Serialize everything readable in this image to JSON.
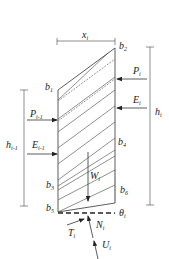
{
  "diagram": {
    "dimension_labels": {
      "width": {
        "base": "x",
        "sub": "i"
      },
      "height_right": {
        "base": "h",
        "sub": "i"
      },
      "height_left": {
        "base": "h",
        "sub": "i-1"
      }
    },
    "points": {
      "b1": {
        "base": "b",
        "sub": "1"
      },
      "b2": {
        "base": "b",
        "sub": "2"
      },
      "b3": {
        "base": "b",
        "sub": "3"
      },
      "b4": {
        "base": "b",
        "sub": "4"
      },
      "b5": {
        "base": "b",
        "sub": "5"
      },
      "b6": {
        "base": "b",
        "sub": "6"
      }
    },
    "forces": {
      "P_i": {
        "base": "P",
        "sub": "i"
      },
      "E_i": {
        "base": "E",
        "sub": "i"
      },
      "P_im1": {
        "base": "P",
        "sub": "i-1"
      },
      "E_im1": {
        "base": "E",
        "sub": "i-1"
      },
      "W_i": {
        "base": "W",
        "sub": "i"
      },
      "T_i": {
        "base": "T",
        "sub": "i"
      },
      "N_i": {
        "base": "N",
        "sub": "i"
      },
      "U_i": {
        "base": "U",
        "sub": "i"
      }
    },
    "angle": {
      "base": "θ",
      "sub": "i"
    }
  }
}
